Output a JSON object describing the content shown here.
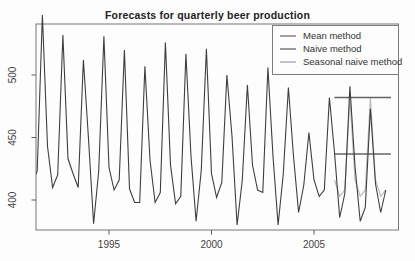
{
  "chart_data": {
    "type": "line",
    "title": "Forecasts for quarterly beer production",
    "xlabel": "",
    "ylabel": "",
    "x_ticks": [
      1995,
      2000,
      2005
    ],
    "y_ticks": [
      400,
      450,
      500
    ],
    "xlim": [
      1991.44,
      2009.12
    ],
    "ylim": [
      376,
      540.8
    ],
    "grid": false,
    "series": [
      {
        "name": "Quarterly beer production (observed)",
        "role": "observed",
        "color": "#3e3e3e",
        "start": 1991.25,
        "step": 0.25,
        "values": [
          414,
          423,
          548,
          443,
          410,
          420,
          532,
          433,
          421,
          410,
          512,
          449,
          381,
          423,
          531,
          426,
          408,
          416,
          520,
          409,
          398,
          398,
          507,
          432,
          398,
          406,
          526,
          428,
          397,
          403,
          517,
          435,
          383,
          424,
          521,
          421,
          402,
          414,
          500,
          451,
          380,
          416,
          492,
          428,
          408,
          406,
          506,
          435,
          380,
          421,
          490,
          435,
          390,
          412,
          454,
          416,
          403,
          408,
          482,
          438,
          386,
          405,
          491,
          427,
          383,
          394,
          473,
          413,
          390,
          408
        ]
      },
      {
        "name": "Mean method",
        "role": "forecast-hline",
        "color": "#646464",
        "value": 436.8,
        "from": 2006.0,
        "to": 2008.75
      },
      {
        "name": "Naive method",
        "role": "forecast-hline",
        "color": "#646464",
        "value": 482,
        "from": 2006.0,
        "to": 2008.75
      },
      {
        "name": "Seasonal naive method",
        "role": "forecast-line",
        "color": "#bcbcbc",
        "start": 2006.0,
        "step": 0.25,
        "values": [
          416,
          403,
          408,
          482,
          416,
          403,
          408,
          482,
          416,
          403,
          408
        ]
      }
    ],
    "legend": {
      "position": "topright",
      "entries": [
        {
          "label": "Mean method",
          "key_color": "#a2a2a2"
        },
        {
          "label": "Naive method",
          "key_color": "#9b9b9b"
        },
        {
          "label": "Seasonal naive method",
          "key_color": "#c4c4c4"
        }
      ]
    },
    "axes": {
      "frame_color": "#777777",
      "tick_color": "#5a5a5a",
      "tick_label_color": "#424242"
    }
  }
}
